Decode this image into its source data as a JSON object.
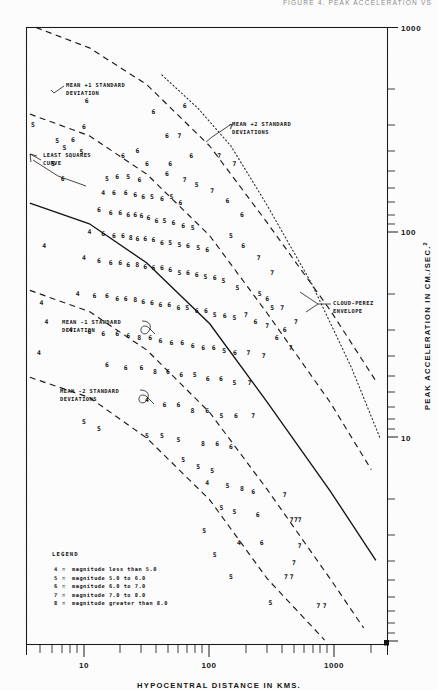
{
  "header": {
    "text": "FIGURE 4. PEAK ACCELERATION VS"
  },
  "figure": {
    "x_axis_label": "HYPOCENTRAL DISTANCE IN KMS.",
    "y_axis_label": "PEAK ACCELERATION IN CM./SEC.",
    "y_axis_label_exponent": "2"
  },
  "axis": {
    "x_ticks": [
      "10",
      "100",
      "1000"
    ],
    "y_ticks": [
      "1000",
      "100",
      "10"
    ]
  },
  "annotations": {
    "mean_plus_1": "MEAN +1 STANDARD\nDEVIATION",
    "mean_plus_1_l1": "MEAN +1 STANDARD",
    "mean_plus_1_l2": "DEVIATION",
    "mean_plus_2_l1": "MEAN +2 STANDARD",
    "mean_plus_2_l2": "DEVIATIONS",
    "least_squares_l1": "LEAST SQUARES",
    "least_squares_l2": "CURVE",
    "mean_minus_1_l1": "MEAN -1 STANDARD",
    "mean_minus_1_l2": "DEVIATION",
    "mean_minus_2_l1": "MEAN -2 STANDARD",
    "mean_minus_2_l2": "DEVIATIONS",
    "cloud_perez_l1": "CLOUD-PEREZ",
    "cloud_perez_l2": "ENVELOPE"
  },
  "legend": {
    "title": "LEGEND",
    "rows": [
      {
        "symbol": "4",
        "text": "magnitude less than 5.0"
      },
      {
        "symbol": "5",
        "text": "magnitude 5.0 to 6.0"
      },
      {
        "symbol": "6",
        "text": "magnitude 6.0 to 7.0"
      },
      {
        "symbol": "7",
        "text": "magnitude 7.0 to 8.0"
      },
      {
        "symbol": "8",
        "text": "magnitude greater than 8.0"
      }
    ]
  },
  "chart_data": {
    "type": "scatter",
    "xlabel": "HYPOCENTRAL DISTANCE IN KMS.",
    "ylabel": "PEAK ACCELERATION IN CM./SEC.2",
    "xscale": "log",
    "yscale": "log",
    "xlim": [
      3.0,
      3000
    ],
    "ylim": [
      0.9,
      1600
    ],
    "grid": false,
    "legend_position": "bottom-left",
    "point_encoding": "digit glyph = earthquake magnitude class",
    "legend_entries": [
      {
        "symbol": "4",
        "label": "magnitude less than 5.0"
      },
      {
        "symbol": "5",
        "label": "magnitude 5.0 to 6.0"
      },
      {
        "symbol": "6",
        "label": "magnitude 6.0 to 7.0"
      },
      {
        "symbol": "7",
        "label": "magnitude 7.0 to 8.0"
      },
      {
        "symbol": "8",
        "label": "magnitude greater than 8.0"
      }
    ],
    "curves": [
      {
        "name": "MEAN +2 STANDARD DEVIATIONS",
        "style": "dashed",
        "x": [
          3.6,
          10,
          30,
          100,
          300,
          1000,
          2400
        ],
        "y": [
          1600,
          1250,
          800,
          380,
          150,
          52,
          22
        ]
      },
      {
        "name": "MEAN +1 STANDARD DEVIATION",
        "style": "dashed",
        "x": [
          3.2,
          10,
          30,
          100,
          300,
          1000,
          2200
        ],
        "y": [
          560,
          430,
          270,
          128,
          50,
          17,
          7.5
        ]
      },
      {
        "name": "LEAST SQUARES CURVE",
        "style": "solid",
        "x": [
          3.2,
          10,
          30,
          100,
          300,
          1000,
          2400
        ],
        "y": [
          190,
          148,
          92,
          44,
          17,
          5.8,
          2.5
        ]
      },
      {
        "name": "MEAN -1 STANDARD DEVIATION",
        "style": "dashed",
        "x": [
          3.2,
          10,
          30,
          100,
          300,
          1000,
          1900
        ],
        "y": [
          66,
          51,
          32,
          15,
          5.9,
          2.0,
          1.1
        ]
      },
      {
        "name": "MEAN -2 STANDARD DEVIATIONS",
        "style": "dashed",
        "x": [
          3.2,
          10,
          30,
          100,
          300,
          900
        ],
        "y": [
          23,
          18,
          11,
          5.2,
          2.0,
          0.95
        ]
      },
      {
        "name": "CLOUD-PEREZ ENVELOPE",
        "style": "dotted",
        "x": [
          40,
          80,
          150,
          300,
          700,
          1500,
          2600
        ],
        "y": [
          900,
          600,
          380,
          185,
          72,
          26,
          11
        ]
      }
    ],
    "points": [
      {
        "m": "5",
        "x": 3.4,
        "y": 480
      },
      {
        "m": "6",
        "x": 9.5,
        "y": 640
      },
      {
        "m": "6",
        "x": 9.0,
        "y": 470
      },
      {
        "m": "6",
        "x": 7.3,
        "y": 400
      },
      {
        "m": "5",
        "x": 5.4,
        "y": 395
      },
      {
        "m": "5",
        "x": 6.2,
        "y": 360
      },
      {
        "m": "5",
        "x": 8.6,
        "y": 345
      },
      {
        "m": "6",
        "x": 19,
        "y": 330
      },
      {
        "m": "6",
        "x": 25,
        "y": 350
      },
      {
        "m": "6",
        "x": 30,
        "y": 300
      },
      {
        "m": "7",
        "x": 56,
        "y": 420
      },
      {
        "m": "6",
        "x": 47,
        "y": 300
      },
      {
        "m": "6",
        "x": 44,
        "y": 265
      },
      {
        "m": "7",
        "x": 62,
        "y": 245
      },
      {
        "m": "5",
        "x": 14,
        "y": 250
      },
      {
        "m": "6",
        "x": 17,
        "y": 255
      },
      {
        "m": "5",
        "x": 21,
        "y": 255
      },
      {
        "m": "6",
        "x": 26,
        "y": 245
      },
      {
        "m": "4",
        "x": 13,
        "y": 210
      },
      {
        "m": "6",
        "x": 16,
        "y": 210
      },
      {
        "m": "6",
        "x": 20,
        "y": 210
      },
      {
        "m": "6",
        "x": 24,
        "y": 205
      },
      {
        "m": "6",
        "x": 28,
        "y": 200
      },
      {
        "m": "5",
        "x": 33,
        "y": 200
      },
      {
        "m": "6",
        "x": 40,
        "y": 195
      },
      {
        "m": "5",
        "x": 48,
        "y": 200
      },
      {
        "m": "6",
        "x": 57,
        "y": 185
      },
      {
        "m": "6",
        "x": 12,
        "y": 170
      },
      {
        "m": "6",
        "x": 15,
        "y": 165
      },
      {
        "m": "6",
        "x": 18,
        "y": 165
      },
      {
        "m": "6",
        "x": 21,
        "y": 160
      },
      {
        "m": "6",
        "x": 24,
        "y": 160
      },
      {
        "m": "6",
        "x": 27,
        "y": 158
      },
      {
        "m": "6",
        "x": 31,
        "y": 155
      },
      {
        "m": "6",
        "x": 36,
        "y": 150
      },
      {
        "m": "5",
        "x": 42,
        "y": 150
      },
      {
        "m": "6",
        "x": 50,
        "y": 145
      },
      {
        "m": "6",
        "x": 60,
        "y": 140
      },
      {
        "m": "5",
        "x": 72,
        "y": 138
      },
      {
        "m": "4",
        "x": 10,
        "y": 130
      },
      {
        "m": "6",
        "x": 13,
        "y": 128
      },
      {
        "m": "6",
        "x": 16,
        "y": 125
      },
      {
        "m": "6",
        "x": 19,
        "y": 125
      },
      {
        "m": "8",
        "x": 22,
        "y": 122
      },
      {
        "m": "6",
        "x": 25,
        "y": 120
      },
      {
        "m": "6",
        "x": 29,
        "y": 120
      },
      {
        "m": "6",
        "x": 34,
        "y": 118
      },
      {
        "m": "6",
        "x": 40,
        "y": 115
      },
      {
        "m": "5",
        "x": 47,
        "y": 115
      },
      {
        "m": "5",
        "x": 56,
        "y": 112
      },
      {
        "m": "6",
        "x": 66,
        "y": 110
      },
      {
        "m": "5",
        "x": 80,
        "y": 108
      },
      {
        "m": "6",
        "x": 95,
        "y": 105
      },
      {
        "m": "4",
        "x": 9,
        "y": 95
      },
      {
        "m": "6",
        "x": 12,
        "y": 92
      },
      {
        "m": "6",
        "x": 15,
        "y": 90
      },
      {
        "m": "6",
        "x": 18,
        "y": 90
      },
      {
        "m": "6",
        "x": 21,
        "y": 88
      },
      {
        "m": "8",
        "x": 25,
        "y": 88
      },
      {
        "m": "6",
        "x": 29,
        "y": 86
      },
      {
        "m": "6",
        "x": 34,
        "y": 85
      },
      {
        "m": "6",
        "x": 40,
        "y": 84
      },
      {
        "m": "6",
        "x": 47,
        "y": 82
      },
      {
        "m": "5",
        "x": 56,
        "y": 80
      },
      {
        "m": "6",
        "x": 66,
        "y": 80
      },
      {
        "m": "6",
        "x": 78,
        "y": 78
      },
      {
        "m": "5",
        "x": 92,
        "y": 76
      },
      {
        "m": "6",
        "x": 110,
        "y": 75
      },
      {
        "m": "5",
        "x": 130,
        "y": 72
      },
      {
        "m": "4",
        "x": 8,
        "y": 62
      },
      {
        "m": "6",
        "x": 11,
        "y": 60
      },
      {
        "m": "6",
        "x": 14,
        "y": 60
      },
      {
        "m": "6",
        "x": 17,
        "y": 58
      },
      {
        "m": "6",
        "x": 20,
        "y": 58
      },
      {
        "m": "8",
        "x": 24,
        "y": 57
      },
      {
        "m": "6",
        "x": 28,
        "y": 56
      },
      {
        "m": "6",
        "x": 33,
        "y": 55
      },
      {
        "m": "6",
        "x": 39,
        "y": 54
      },
      {
        "m": "6",
        "x": 46,
        "y": 54
      },
      {
        "m": "6",
        "x": 55,
        "y": 52
      },
      {
        "m": "5",
        "x": 65,
        "y": 52
      },
      {
        "m": "6",
        "x": 78,
        "y": 50
      },
      {
        "m": "6",
        "x": 93,
        "y": 50
      },
      {
        "m": "5",
        "x": 110,
        "y": 48
      },
      {
        "m": "6",
        "x": 133,
        "y": 47
      },
      {
        "m": "5",
        "x": 160,
        "y": 46
      },
      {
        "m": "7",
        "x": 200,
        "y": 48
      },
      {
        "m": "6",
        "x": 240,
        "y": 44
      },
      {
        "m": "7",
        "x": 300,
        "y": 42
      },
      {
        "m": "4",
        "x": 7,
        "y": 40
      },
      {
        "m": "6",
        "x": 10,
        "y": 39
      },
      {
        "m": "6",
        "x": 13,
        "y": 38
      },
      {
        "m": "6",
        "x": 17,
        "y": 38
      },
      {
        "m": "6",
        "x": 21,
        "y": 37
      },
      {
        "m": "8",
        "x": 26,
        "y": 36
      },
      {
        "m": "6",
        "x": 32,
        "y": 36
      },
      {
        "m": "6",
        "x": 39,
        "y": 35
      },
      {
        "m": "6",
        "x": 48,
        "y": 34
      },
      {
        "m": "6",
        "x": 59,
        "y": 34
      },
      {
        "m": "6",
        "x": 72,
        "y": 33
      },
      {
        "m": "6",
        "x": 88,
        "y": 32
      },
      {
        "m": "6",
        "x": 108,
        "y": 32
      },
      {
        "m": "5",
        "x": 132,
        "y": 31
      },
      {
        "m": "6",
        "x": 162,
        "y": 30
      },
      {
        "m": "7",
        "x": 210,
        "y": 30
      },
      {
        "m": "7",
        "x": 280,
        "y": 29
      },
      {
        "m": "6",
        "x": 14,
        "y": 26
      },
      {
        "m": "6",
        "x": 20,
        "y": 25
      },
      {
        "m": "6",
        "x": 27,
        "y": 25
      },
      {
        "m": "8",
        "x": 35,
        "y": 24
      },
      {
        "m": "6",
        "x": 45,
        "y": 24
      },
      {
        "m": "6",
        "x": 58,
        "y": 23
      },
      {
        "m": "5",
        "x": 75,
        "y": 23
      },
      {
        "m": "6",
        "x": 96,
        "y": 22
      },
      {
        "m": "6",
        "x": 124,
        "y": 22
      },
      {
        "m": "5",
        "x": 160,
        "y": 21
      },
      {
        "m": "7",
        "x": 215,
        "y": 21
      },
      {
        "m": "4",
        "x": 30,
        "y": 17
      },
      {
        "m": "6",
        "x": 42,
        "y": 16
      },
      {
        "m": "6",
        "x": 55,
        "y": 16
      },
      {
        "m": "8",
        "x": 72,
        "y": 15
      },
      {
        "m": "6",
        "x": 95,
        "y": 15
      },
      {
        "m": "5",
        "x": 125,
        "y": 14
      },
      {
        "m": "6",
        "x": 165,
        "y": 14
      },
      {
        "m": "7",
        "x": 230,
        "y": 14
      },
      {
        "m": "5",
        "x": 9,
        "y": 13
      },
      {
        "m": "5",
        "x": 12,
        "y": 12
      },
      {
        "m": "5",
        "x": 30,
        "y": 11
      },
      {
        "m": "5",
        "x": 40,
        "y": 11
      },
      {
        "m": "5",
        "x": 55,
        "y": 10.5
      },
      {
        "m": "8",
        "x": 88,
        "y": 10
      },
      {
        "m": "6",
        "x": 115,
        "y": 10
      },
      {
        "m": "6",
        "x": 150,
        "y": 9.6
      },
      {
        "m": "5",
        "x": 60,
        "y": 8.2
      },
      {
        "m": "5",
        "x": 80,
        "y": 7.6
      },
      {
        "m": "5",
        "x": 105,
        "y": 7.2
      },
      {
        "m": "4",
        "x": 95,
        "y": 6.2
      },
      {
        "m": "5",
        "x": 140,
        "y": 6.0
      },
      {
        "m": "8",
        "x": 185,
        "y": 5.8
      },
      {
        "m": "6",
        "x": 230,
        "y": 5.6
      },
      {
        "m": "7",
        "x": 420,
        "y": 5.4
      },
      {
        "m": "5",
        "x": 125,
        "y": 4.6
      },
      {
        "m": "5",
        "x": 160,
        "y": 4.4
      },
      {
        "m": "6",
        "x": 250,
        "y": 4.2
      },
      {
        "m": "7",
        "x": 480,
        "y": 4.0
      },
      {
        "m": "7",
        "x": 520,
        "y": 4.0
      },
      {
        "m": "7",
        "x": 560,
        "y": 4.0
      },
      {
        "m": "4",
        "x": 175,
        "y": 3.0
      },
      {
        "m": "6",
        "x": 270,
        "y": 3.0
      },
      {
        "m": "7",
        "x": 560,
        "y": 2.9
      },
      {
        "m": "5",
        "x": 150,
        "y": 2.0
      },
      {
        "m": "7",
        "x": 430,
        "y": 2.0
      },
      {
        "m": "7",
        "x": 480,
        "y": 2.0
      },
      {
        "m": "5",
        "x": 320,
        "y": 1.45
      },
      {
        "m": "7",
        "x": 800,
        "y": 1.4
      },
      {
        "m": "7",
        "x": 900,
        "y": 1.4
      },
      {
        "m": "7",
        "x": 500,
        "y": 2.35
      },
      {
        "m": "5",
        "x": 90,
        "y": 3.5
      },
      {
        "m": "5",
        "x": 110,
        "y": 2.6
      },
      {
        "m": "6",
        "x": 44,
        "y": 420
      },
      {
        "m": "6",
        "x": 70,
        "y": 330
      },
      {
        "m": "7",
        "x": 120,
        "y": 330
      },
      {
        "m": "7",
        "x": 160,
        "y": 300
      },
      {
        "m": "5",
        "x": 78,
        "y": 230
      },
      {
        "m": "7",
        "x": 105,
        "y": 215
      },
      {
        "m": "6",
        "x": 140,
        "y": 190
      },
      {
        "m": "6",
        "x": 185,
        "y": 160
      },
      {
        "m": "5",
        "x": 150,
        "y": 125
      },
      {
        "m": "6",
        "x": 190,
        "y": 110
      },
      {
        "m": "7",
        "x": 255,
        "y": 95
      },
      {
        "m": "7",
        "x": 330,
        "y": 80
      },
      {
        "m": "5",
        "x": 170,
        "y": 66
      },
      {
        "m": "6",
        "x": 300,
        "y": 58
      },
      {
        "m": "7",
        "x": 400,
        "y": 52
      },
      {
        "m": "7",
        "x": 520,
        "y": 44
      },
      {
        "m": "6",
        "x": 360,
        "y": 36
      },
      {
        "m": "7",
        "x": 470,
        "y": 32
      },
      {
        "m": "5",
        "x": 260,
        "y": 62
      },
      {
        "m": "5",
        "x": 330,
        "y": 52
      },
      {
        "m": "6",
        "x": 420,
        "y": 40
      },
      {
        "m": "5",
        "x": 5.0,
        "y": 300
      },
      {
        "m": "6",
        "x": 6.0,
        "y": 250
      },
      {
        "m": "4",
        "x": 4.2,
        "y": 110
      },
      {
        "m": "4",
        "x": 4.0,
        "y": 55
      },
      {
        "m": "4",
        "x": 3.8,
        "y": 30
      },
      {
        "m": "4",
        "x": 4.4,
        "y": 44
      },
      {
        "m": "6",
        "x": 62,
        "y": 600
      },
      {
        "m": "7",
        "x": 150,
        "y": 470
      },
      {
        "m": "6",
        "x": 34,
        "y": 560
      }
    ]
  }
}
